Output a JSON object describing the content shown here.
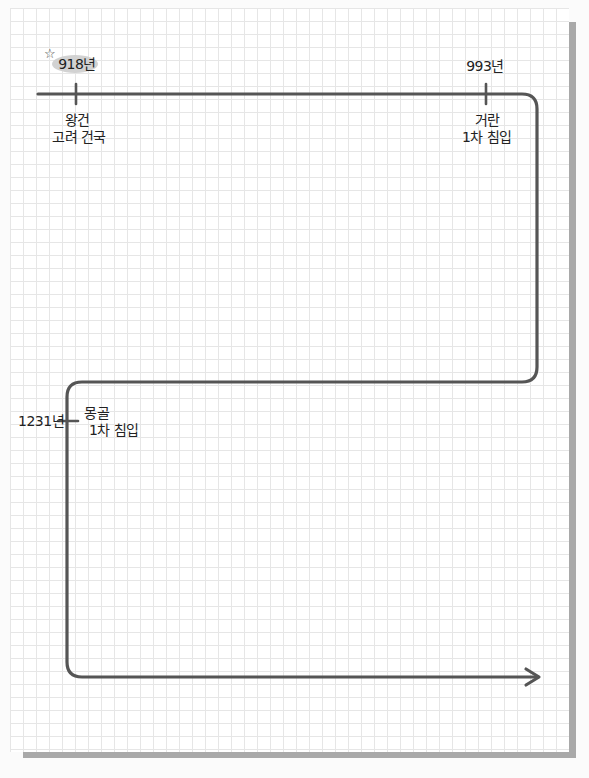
{
  "timeline": {
    "line_color": "#555555",
    "events": [
      {
        "year": "918년",
        "desc_line1": "왕건",
        "desc_line2": "고려 건국",
        "highlighted": true
      },
      {
        "year": "993년",
        "desc_line1": "거란",
        "desc_line2": "1차 침입",
        "highlighted": false
      },
      {
        "year": "1231년",
        "desc_line1": "몽골",
        "desc_line2": "1차 침입",
        "highlighted": false
      }
    ],
    "decoration": {
      "star_icon": "☆"
    }
  }
}
